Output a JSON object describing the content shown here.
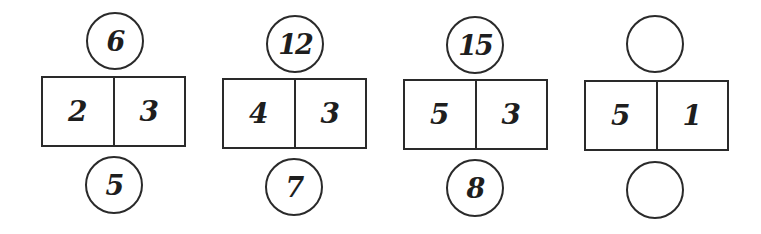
{
  "puzzle": {
    "description": "Number pattern puzzle: each column has a top circle, a two-cell box, and a bottom circle",
    "groups": [
      {
        "top": "6",
        "left": "2",
        "right": "3",
        "bottom": "5"
      },
      {
        "top": "12",
        "left": "4",
        "right": "3",
        "bottom": "7"
      },
      {
        "top": "15",
        "left": "5",
        "right": "3",
        "bottom": "8"
      },
      {
        "top": "",
        "left": "5",
        "right": "1",
        "bottom": ""
      }
    ]
  },
  "colors": {
    "stroke": "#2a2a2a",
    "text": "#1e1e1e",
    "background": "#ffffff"
  }
}
